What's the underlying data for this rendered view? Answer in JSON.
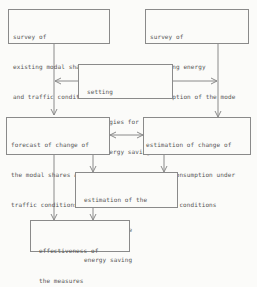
{
  "diagram": {
    "nodes": [
      {
        "id": "survey_modal",
        "lines": [
          "survey of",
          "existing modal shares",
          "and traffic conditions"
        ]
      },
      {
        "id": "survey_energy",
        "lines": [
          "survey of",
          "existing energy",
          "consumption of the mode"
        ]
      },
      {
        "id": "setting_strategies",
        "lines": [
          "setting",
          "strategies for",
          "the energy savings"
        ]
      },
      {
        "id": "forecast",
        "lines": [
          "forecast of change of",
          "the modal shares and",
          "traffic conditions"
        ]
      },
      {
        "id": "estimation_change",
        "lines": [
          "estimation of change of",
          "energy consumption under",
          "standard conditions"
        ]
      },
      {
        "id": "estimation_amount",
        "lines": [
          "estimation of the",
          "amount of the",
          "energy saving"
        ]
      },
      {
        "id": "effectiveness",
        "lines": [
          "effectiveness of",
          "the measures"
        ]
      }
    ],
    "edges": [
      {
        "from": "survey_modal",
        "to": "forecast"
      },
      {
        "from": "survey_energy",
        "to": "estimation_change"
      },
      {
        "from": "setting_strategies",
        "to": "forecast"
      },
      {
        "from": "setting_strategies",
        "to": "estimation_change"
      },
      {
        "from": "forecast",
        "to": "estimation_change",
        "bidirectional": true
      },
      {
        "from": "forecast",
        "to": "estimation_amount"
      },
      {
        "from": "estimation_change",
        "to": "estimation_amount"
      },
      {
        "from": "forecast",
        "to": "effectiveness"
      },
      {
        "from": "estimation_amount",
        "to": "effectiveness"
      }
    ]
  }
}
